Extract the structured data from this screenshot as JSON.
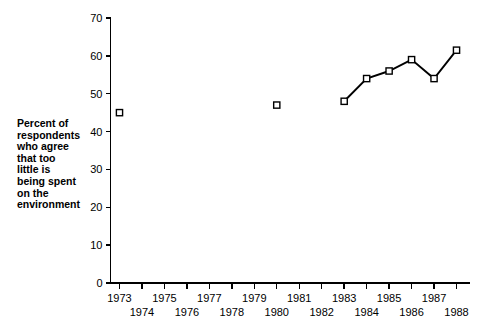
{
  "chart_data": {
    "type": "line",
    "title": "",
    "subtitle": "",
    "xlabel": "",
    "ylabel": "Percent of respondents who agree that too little is being spent on the environment",
    "ylabel_lines": [
      "Percent of",
      "respondents",
      "who agree",
      "that too",
      "little is",
      "being spent",
      "on the",
      "environment"
    ],
    "xlim": [
      1972.6,
      1988.6
    ],
    "ylim": [
      0,
      70
    ],
    "yticks": [
      0,
      10,
      20,
      30,
      40,
      50,
      60,
      70
    ],
    "ytick_labels": [
      "0",
      "10",
      "20",
      "30",
      "40",
      "50",
      "60",
      "70"
    ],
    "xticks": [
      1973,
      1974,
      1975,
      1976,
      1977,
      1978,
      1979,
      1980,
      1981,
      1982,
      1983,
      1984,
      1985,
      1986,
      1987,
      1988
    ],
    "xtick_labels": [
      "1973",
      "1974",
      "1975",
      "1976",
      "1977",
      "1978",
      "1979",
      "1980",
      "1981",
      "1982",
      "1983",
      "1984",
      "1985",
      "1986",
      "1987",
      "1988"
    ],
    "xtick_label_rows": [
      0,
      1,
      0,
      1,
      0,
      1,
      0,
      1,
      0,
      1,
      0,
      1,
      0,
      1,
      0,
      1
    ],
    "grid": false,
    "legend": false,
    "legend_position": "none",
    "marker": "open-square",
    "marker_fill": "#ffffff",
    "line_color": "#000000",
    "series": [
      {
        "name": "Percent who agree too little is being spent on the environment",
        "connected": false,
        "x": [
          1973
        ],
        "values": [
          45
        ]
      },
      {
        "name": "Percent who agree too little is being spent on the environment",
        "connected": false,
        "x": [
          1980
        ],
        "values": [
          47
        ]
      },
      {
        "name": "Percent who agree too little is being spent on the environment",
        "connected": true,
        "x": [
          1983,
          1984,
          1985,
          1986,
          1987,
          1988
        ],
        "values": [
          48,
          54,
          56,
          59,
          54,
          61.5
        ]
      }
    ],
    "points": [
      {
        "x": 1973,
        "y": 45
      },
      {
        "x": 1980,
        "y": 47
      },
      {
        "x": 1983,
        "y": 48
      },
      {
        "x": 1984,
        "y": 54
      },
      {
        "x": 1985,
        "y": 56
      },
      {
        "x": 1986,
        "y": 59
      },
      {
        "x": 1987,
        "y": 54
      },
      {
        "x": 1988,
        "y": 61.5
      }
    ]
  }
}
